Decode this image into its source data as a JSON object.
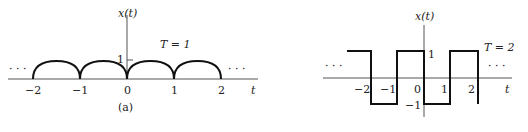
{
  "panel_a": {
    "y_label": "x(t)",
    "x_label": "t",
    "period_label": "T = 1",
    "y_tick": "1",
    "x_ticks": [
      "−2",
      "−1",
      "0",
      "1",
      "2"
    ],
    "ellipsis_left": "· · ·",
    "ellipsis_right": "· · ·",
    "caption": "(a)",
    "waveform": "periodic semicircular arcs |sin(πt)|-like, peak 1, period 1"
  },
  "panel_b": {
    "y_label": "x(t)",
    "x_label": "t",
    "period_label": "T = 2",
    "y_tick_high": "1",
    "y_tick_low": "−1",
    "x_ticks": [
      "−2",
      "−1",
      "0",
      "1",
      "2"
    ],
    "ellipsis_left": "· · ·",
    "ellipsis_right": "· · ·",
    "waveform": "square wave ±1, period 2"
  }
}
